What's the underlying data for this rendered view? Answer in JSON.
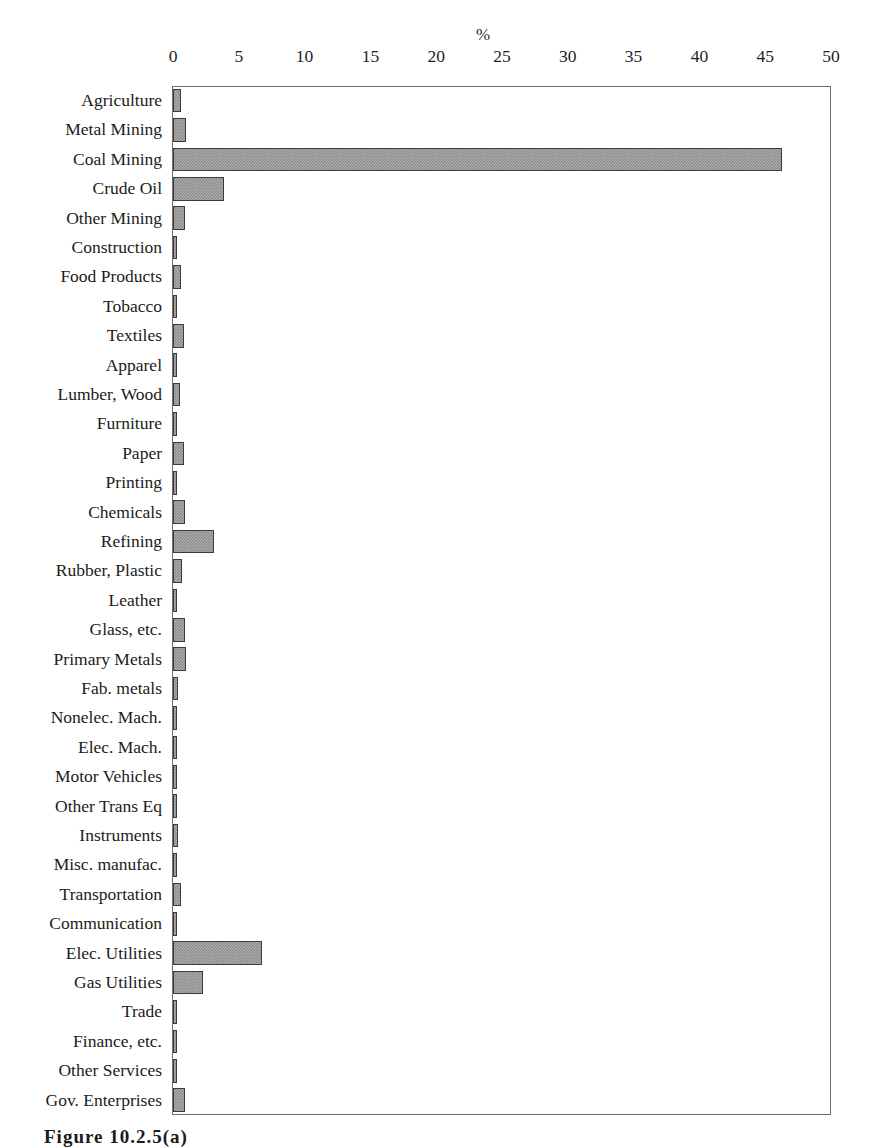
{
  "figure": {
    "caption": "Figure 10.2.5(a)",
    "background_color": "#ffffff",
    "bar_color": "#8d8d8d",
    "bar_border_color": "#3b3b3b",
    "frame_color": "#6f6f6f"
  },
  "chart_data": {
    "type": "bar",
    "orientation": "horizontal",
    "title": "",
    "xlabel": "%",
    "ylabel": "",
    "xlim": [
      0,
      50
    ],
    "xticks": [
      0,
      5,
      10,
      15,
      20,
      25,
      30,
      35,
      40,
      45,
      50
    ],
    "grid": false,
    "legend": null,
    "axis_title_position": "top-center-above-25",
    "categories": [
      "Agriculture",
      "Metal Mining",
      "Coal Mining",
      "Crude Oil",
      "Other Mining",
      "Construction",
      "Food Products",
      "Tobacco",
      "Textiles",
      "Apparel",
      "Lumber, Wood",
      "Furniture",
      "Paper",
      "Printing",
      "Chemicals",
      "Refining",
      "Rubber, Plastic",
      "Leather",
      "Glass, etc.",
      "Primary Metals",
      "Fab. metals",
      "Nonelec. Mach.",
      "Elec. Mach.",
      "Motor Vehicles",
      "Other Trans Eq",
      "Instruments",
      "Misc. manufac.",
      "Transportation",
      "Communication",
      "Elec. Utilities",
      "Gas Utilities",
      "Trade",
      "Finance, etc.",
      "Other Services",
      "Gov. Enterprises"
    ],
    "values": [
      0.6,
      1.0,
      46.3,
      3.9,
      0.9,
      0.3,
      0.6,
      0.3,
      0.8,
      0.3,
      0.5,
      0.3,
      0.8,
      0.3,
      0.9,
      3.1,
      0.7,
      0.2,
      0.9,
      1.0,
      0.4,
      0.3,
      0.2,
      0.3,
      0.3,
      0.4,
      0.3,
      0.6,
      0.3,
      6.8,
      2.3,
      0.3,
      0.2,
      0.3,
      0.9
    ]
  }
}
